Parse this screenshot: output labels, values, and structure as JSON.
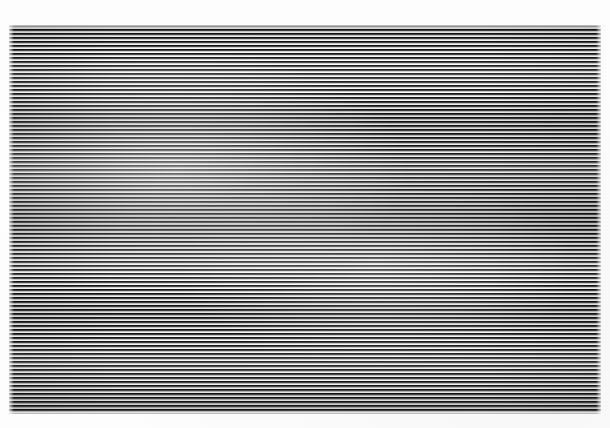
{
  "image": {
    "kind": "scanned-line-pattern",
    "subject_name": "horizontal-stripe-pattern",
    "width_px": 610,
    "height_px": 428,
    "orientation": "horizontal-lines",
    "caption": "",
    "has_text": false,
    "has_ui_controls": false
  },
  "background": {
    "color": "#ffffff",
    "paper_color": "#fdfdfd"
  },
  "pattern": {
    "region": {
      "left_px": 9,
      "top_px": 25,
      "right_px": 601,
      "bottom_px": 414,
      "width_px": 592,
      "height_px": 389
    },
    "line_period_px": 4,
    "dark_band_px": 2,
    "light_band_px": 2,
    "approx_line_count": 97,
    "dark_color": "#141414",
    "mid_color": "#5a5a5a",
    "light_color": "#fafafa",
    "tone_note": "slightly lighter cloudy wash toward centre-left, darker toward left and right margins"
  },
  "margins": {
    "top_px": 25,
    "left_px": 9,
    "right_px": 9,
    "bottom_px": 14,
    "color": "#ffffff"
  }
}
